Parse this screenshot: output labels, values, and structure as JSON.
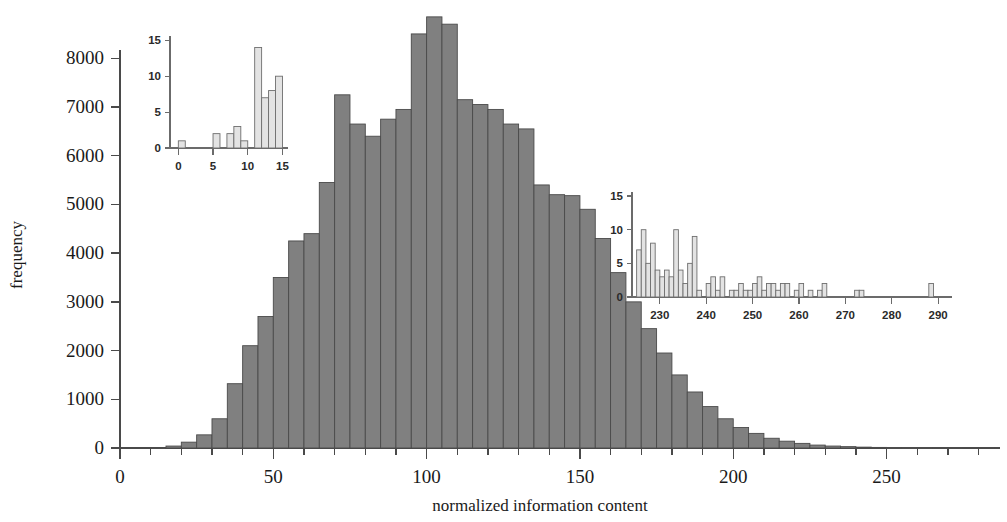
{
  "figure": {
    "background_color": "#ffffff",
    "bar_fill_color": "#808080",
    "bar_edge_color": "#4a4a4a",
    "inset_bar_fill_color": "#e3e3e3",
    "inset_bar_edge_color": "#6e6e6e",
    "axis_color": "#4a4a4a"
  },
  "chart_data": {
    "type": "bar",
    "title": "",
    "subtitle": "",
    "xlabel": "normalized information content",
    "ylabel": "frequency",
    "xlim": [
      0,
      287
    ],
    "ylim": [
      0,
      8950
    ],
    "grid": false,
    "legend": null,
    "bin_width": 5,
    "xticks": [
      0,
      50,
      100,
      150,
      200,
      250
    ],
    "xtick_labels": [
      "0",
      "50",
      "100",
      "150",
      "200",
      "250"
    ],
    "xminor_step": 10,
    "yticks": [
      0,
      1000,
      2000,
      3000,
      4000,
      5000,
      6000,
      7000,
      8000
    ],
    "ytick_labels": [
      "0",
      "1000",
      "2000",
      "3000",
      "4000",
      "5000",
      "6000",
      "7000",
      "8000"
    ],
    "bin_left_edges": [
      0,
      5,
      10,
      15,
      20,
      25,
      30,
      35,
      40,
      45,
      50,
      55,
      60,
      65,
      70,
      75,
      80,
      85,
      90,
      95,
      100,
      105,
      110,
      115,
      120,
      125,
      130,
      135,
      140,
      145,
      150,
      155,
      160,
      165,
      170,
      175,
      180,
      185,
      190,
      195,
      200,
      205,
      210,
      215,
      220,
      225,
      230,
      235,
      240,
      245,
      250,
      255,
      260,
      265,
      270,
      275,
      280
    ],
    "values": [
      0,
      0,
      10,
      40,
      120,
      270,
      600,
      1320,
      2100,
      2700,
      3500,
      4250,
      4400,
      5450,
      7250,
      6650,
      6400,
      6750,
      6950,
      8500,
      8850,
      8700,
      7150,
      7050,
      6950,
      6650,
      6550,
      5400,
      5200,
      5180,
      4900,
      4300,
      3600,
      3000,
      2450,
      1950,
      1500,
      1150,
      850,
      600,
      420,
      300,
      200,
      140,
      95,
      60,
      40,
      28,
      18,
      12,
      8,
      6,
      4,
      3,
      2,
      1,
      1
    ]
  },
  "inset_left": {
    "chart_data": {
      "type": "bar",
      "xlabel": "",
      "ylabel": "",
      "xlim": [
        -1.2,
        15.8
      ],
      "ylim": [
        0,
        15.6
      ],
      "grid": false,
      "bin_width": 1,
      "xticks": [
        0,
        5,
        10,
        15
      ],
      "xtick_labels": [
        "0",
        "5",
        "10",
        "15"
      ],
      "yticks": [
        0,
        5,
        10,
        15
      ],
      "ytick_labels": [
        "0",
        "5",
        "10",
        "15"
      ],
      "bin_left_edges": [
        0,
        5,
        7,
        8,
        9,
        11,
        12,
        13,
        14
      ],
      "values": [
        1,
        2,
        2,
        3,
        1,
        14,
        7,
        8,
        10
      ]
    }
  },
  "inset_right": {
    "chart_data": {
      "type": "bar",
      "xlabel": "",
      "ylabel": "",
      "xlim": [
        224,
        293
      ],
      "ylim": [
        0,
        15.6
      ],
      "grid": false,
      "bin_width": 1,
      "xticks": [
        230,
        240,
        250,
        260,
        270,
        280,
        290
      ],
      "xtick_labels": [
        "230",
        "240",
        "250",
        "260",
        "270",
        "280",
        "290"
      ],
      "yticks": [
        0,
        5,
        10,
        15
      ],
      "ytick_labels": [
        "0",
        "5",
        "10",
        "15"
      ],
      "bin_left_edges": [
        225,
        226,
        227,
        228,
        229,
        230,
        231,
        232,
        233,
        234,
        235,
        236,
        237,
        238,
        240,
        241,
        242,
        243,
        245,
        246,
        247,
        248,
        249,
        250,
        251,
        252,
        253,
        254,
        255,
        256,
        257,
        259,
        260,
        262,
        264,
        265,
        269,
        272,
        273,
        278,
        288,
        289
      ],
      "values": [
        7,
        10,
        5,
        8,
        4,
        3,
        4,
        3,
        10,
        4,
        2,
        5,
        9,
        1,
        2,
        3,
        1,
        3,
        1,
        1,
        2,
        1,
        1,
        2,
        3,
        1,
        2,
        2,
        1,
        2,
        2,
        1,
        2,
        1,
        1,
        2,
        0,
        1,
        1,
        0,
        2,
        0
      ]
    }
  }
}
